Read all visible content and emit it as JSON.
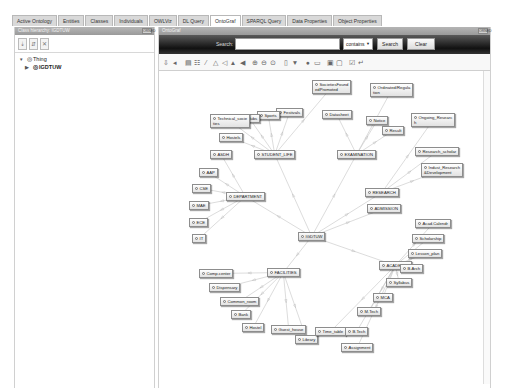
{
  "tabs": [
    {
      "label": "Active Ontology",
      "active": false
    },
    {
      "label": "Entities",
      "active": false
    },
    {
      "label": "Classes",
      "active": false
    },
    {
      "label": "Individuals",
      "active": false
    },
    {
      "label": "OWLViz",
      "active": false
    },
    {
      "label": "DL Query",
      "active": false
    },
    {
      "label": "OntoGraf",
      "active": true
    },
    {
      "label": "SPARQL Query",
      "active": false
    },
    {
      "label": "Data Properties",
      "active": false
    },
    {
      "label": "Object Properties",
      "active": false
    }
  ],
  "left_panel": {
    "header": "Class hierarchy: IGDTUW",
    "header_button": "ORNED",
    "toolbar_icons": [
      "add-subclass-icon",
      "add-sibling-icon",
      "delete-class-icon"
    ],
    "tree": [
      {
        "label": "Thing",
        "expanded": true,
        "level": 0
      },
      {
        "label": "IGDTUW",
        "expanded": false,
        "level": 1
      }
    ]
  },
  "right_panel": {
    "header": "OntoGraf",
    "header_button": "ORNED",
    "search": {
      "label": "Search:",
      "value": "",
      "mode": "contains",
      "search_button": "Search",
      "clear_button": "Clear"
    },
    "toolbar_icons": [
      "pin-icon",
      "unpin-icon",
      "grid-layout-icon",
      "vertical-tree-icon",
      "radial-layout-icon",
      "spring-layout-icon",
      "horizontal-tree-icon",
      "vertical-directed-icon",
      "horizontal-directed-icon",
      "zoom-in-icon",
      "zoom-out-icon",
      "zoom-fit-icon",
      "filter-node-icon",
      "filter-arc-icon",
      "noise-icon",
      "export-icon",
      "snapshot-icon",
      "save-icon",
      "check-icon",
      "apply-icon"
    ]
  },
  "graph": {
    "root": {
      "label": "IGDTUW",
      "x": 139,
      "y": 161
    },
    "nodes": [
      {
        "id": "student_life",
        "label": "STUDENT_LIFE",
        "x": 95,
        "y": 79
      },
      {
        "id": "examination",
        "label": "EXAMINATION",
        "x": 178,
        "y": 79
      },
      {
        "id": "research",
        "label": "RESEARCH",
        "x": 206,
        "y": 117
      },
      {
        "id": "admission",
        "label": "ADMISSION",
        "x": 208,
        "y": 133
      },
      {
        "id": "department",
        "label": "DEPARTMENT",
        "x": 67,
        "y": 121
      },
      {
        "id": "facilities",
        "label": "FACILITIES",
        "x": 108,
        "y": 197
      },
      {
        "id": "academic",
        "label": "ACADEMIC",
        "x": 220,
        "y": 190
      },
      {
        "id": "societies",
        "label": "SocietiesFound\nedPromoted",
        "x": 153,
        "y": 9
      },
      {
        "id": "ordinated",
        "label": "Ordinated/Regula\ntion",
        "x": 211,
        "y": 12
      },
      {
        "id": "datasheet",
        "label": "Datasheet",
        "x": 163,
        "y": 39
      },
      {
        "id": "festivals",
        "label": "Festivals",
        "x": 117,
        "y": 37
      },
      {
        "id": "sports",
        "label": "Sports",
        "x": 98,
        "y": 40
      },
      {
        "id": "clubs",
        "label": "Clubs",
        "x": 80,
        "y": 43
      },
      {
        "id": "technical",
        "label": "Technical_socie\nties",
        "x": 51,
        "y": 43
      },
      {
        "id": "hostels",
        "label": "Hostels",
        "x": 60,
        "y": 62
      },
      {
        "id": "notice",
        "label": "Notice",
        "x": 207,
        "y": 45
      },
      {
        "id": "result",
        "label": "Result",
        "x": 223,
        "y": 55
      },
      {
        "id": "ongoing",
        "label": "Ongoing_Researc\nh",
        "x": 252,
        "y": 42
      },
      {
        "id": "research_scholar",
        "label": "Research_scholar",
        "x": 256,
        "y": 76
      },
      {
        "id": "indust",
        "label": "Indust_Research\n&Development",
        "x": 262,
        "y": 92
      },
      {
        "id": "asdh",
        "label": "ASDH",
        "x": 51,
        "y": 79
      },
      {
        "id": "aap",
        "label": "AAP",
        "x": 40,
        "y": 97
      },
      {
        "id": "cse",
        "label": "CSE",
        "x": 33,
        "y": 113
      },
      {
        "id": "mae",
        "label": "MAE",
        "x": 30,
        "y": 130
      },
      {
        "id": "ece",
        "label": "ECE",
        "x": 30,
        "y": 147
      },
      {
        "id": "it",
        "label": "IT",
        "x": 33,
        "y": 163
      },
      {
        "id": "comp_center",
        "label": "Comp.center",
        "x": 40,
        "y": 198
      },
      {
        "id": "dispensary",
        "label": "Dispensary",
        "x": 50,
        "y": 212
      },
      {
        "id": "common_room",
        "label": "Common_room",
        "x": 61,
        "y": 226
      },
      {
        "id": "bank",
        "label": "Bank",
        "x": 72,
        "y": 239
      },
      {
        "id": "hostel",
        "label": "Hostel",
        "x": 83,
        "y": 252
      },
      {
        "id": "guest_house",
        "label": "Guest_house",
        "x": 112,
        "y": 254
      },
      {
        "id": "library",
        "label": "Library",
        "x": 136,
        "y": 264
      },
      {
        "id": "time_table",
        "label": "Time_table",
        "x": 156,
        "y": 256
      },
      {
        "id": "btech",
        "label": "B.Tech",
        "x": 186,
        "y": 256
      },
      {
        "id": "assignment",
        "label": "Assignment",
        "x": 182,
        "y": 272
      },
      {
        "id": "mtech",
        "label": "M.Tech",
        "x": 198,
        "y": 236
      },
      {
        "id": "mca",
        "label": "MCA",
        "x": 214,
        "y": 222
      },
      {
        "id": "syllabus",
        "label": "Syllabus",
        "x": 227,
        "y": 207
      },
      {
        "id": "barch",
        "label": "B.Arch",
        "x": 241,
        "y": 193
      },
      {
        "id": "lesson_plan",
        "label": "Lesson_plan",
        "x": 249,
        "y": 178
      },
      {
        "id": "scholarship",
        "label": "Scholarship",
        "x": 253,
        "y": 163
      },
      {
        "id": "acad_calendar",
        "label": "Acad.Calendr",
        "x": 256,
        "y": 148
      }
    ],
    "edges": [
      [
        "root",
        "student_life"
      ],
      [
        "root",
        "examination"
      ],
      [
        "root",
        "research"
      ],
      [
        "root",
        "admission"
      ],
      [
        "root",
        "department"
      ],
      [
        "root",
        "facilities"
      ],
      [
        "root",
        "academic"
      ],
      [
        "student_life",
        "festivals"
      ],
      [
        "student_life",
        "sports"
      ],
      [
        "student_life",
        "clubs"
      ],
      [
        "student_life",
        "technical"
      ],
      [
        "student_life",
        "hostels"
      ],
      [
        "student_life",
        "societies"
      ],
      [
        "examination",
        "datasheet"
      ],
      [
        "examination",
        "notice"
      ],
      [
        "examination",
        "result"
      ],
      [
        "examination",
        "ordinated"
      ],
      [
        "research",
        "ongoing"
      ],
      [
        "research",
        "research_scholar"
      ],
      [
        "research",
        "indust"
      ],
      [
        "department",
        "asdh"
      ],
      [
        "department",
        "aap"
      ],
      [
        "department",
        "cse"
      ],
      [
        "department",
        "mae"
      ],
      [
        "department",
        "ece"
      ],
      [
        "department",
        "it"
      ],
      [
        "facilities",
        "comp_center"
      ],
      [
        "facilities",
        "dispensary"
      ],
      [
        "facilities",
        "common_room"
      ],
      [
        "facilities",
        "bank"
      ],
      [
        "facilities",
        "hostel"
      ],
      [
        "facilities",
        "guest_house"
      ],
      [
        "facilities",
        "library"
      ],
      [
        "academic",
        "acad_calendar"
      ],
      [
        "academic",
        "scholarship"
      ],
      [
        "academic",
        "lesson_plan"
      ],
      [
        "academic",
        "barch"
      ],
      [
        "academic",
        "syllabus"
      ],
      [
        "academic",
        "mca"
      ],
      [
        "academic",
        "mtech"
      ],
      [
        "academic",
        "btech"
      ],
      [
        "academic",
        "assignment"
      ],
      [
        "academic",
        "time_table"
      ]
    ]
  },
  "colors": {
    "search_bar_dark": "#111111",
    "panel_header": "#a6a6a6",
    "edge": "#c4c4c4",
    "node_border": "#8d8d8d"
  }
}
